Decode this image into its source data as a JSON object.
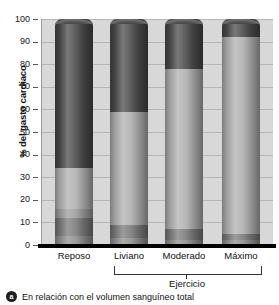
{
  "chart_data": {
    "type": "bar",
    "title": "",
    "subtitle": "",
    "xlabel": "",
    "ylabel": "% del gasto cardiaco",
    "ylim": [
      0,
      100
    ],
    "yticks": [
      0,
      10,
      20,
      30,
      40,
      50,
      60,
      70,
      80,
      90,
      100
    ],
    "grid": true,
    "stacked": true,
    "legend": "none",
    "categories": [
      "Reposo",
      "Liviano",
      "Moderado",
      "Máximo"
    ],
    "series": [
      {
        "name": "segmento-inferior-1",
        "values": [
          4,
          3,
          2,
          2
        ],
        "color": "#8f8f8f"
      },
      {
        "name": "segmento-inferior-2",
        "values": [
          8,
          6,
          5,
          3
        ],
        "color": "#7a7a7a"
      },
      {
        "name": "segmento-medio-bajo",
        "values": [
          4,
          0,
          0,
          0
        ],
        "color": "#9c9c9c"
      },
      {
        "name": "segmento-medio",
        "values": [
          18,
          50,
          71,
          87
        ],
        "color": "#b0b0b0"
      },
      {
        "name": "segmento-superior",
        "values": [
          66,
          41,
          22,
          8
        ],
        "color": "#4a4a4a"
      }
    ],
    "bar_boundaries": {
      "Reposo": [
        0,
        4,
        12,
        16,
        34,
        100
      ],
      "Liviano": [
        0,
        3,
        9,
        9,
        59,
        100
      ],
      "Moderado": [
        0,
        2,
        7,
        7,
        78,
        100
      ],
      "Máximo": [
        0,
        2,
        5,
        5,
        92,
        100
      ]
    },
    "annotations": {
      "bracket_label": "Ejercicio",
      "bracket_spans": [
        "Liviano",
        "Moderado",
        "Máximo"
      ]
    }
  },
  "axis": {
    "y_title": "% del gasto cardiaco",
    "tick_labels": [
      "100",
      "90",
      "80",
      "70",
      "60",
      "50",
      "40",
      "30",
      "20",
      "10",
      "0"
    ]
  },
  "categories": [
    {
      "label": "Reposo"
    },
    {
      "label": "Liviano"
    },
    {
      "label": "Moderado"
    },
    {
      "label": "Máximo"
    }
  ],
  "bracket": {
    "label": "Ejercicio"
  },
  "footnote": {
    "badge": "a",
    "text": "En relación con el volumen sanguíneo total"
  },
  "colors": {
    "plot_background": "#d8d8d8",
    "gridline": "#b6b6b6",
    "baseline": "#000000",
    "seg_dark": "#4a4a4a",
    "seg_light": "#b0b0b0",
    "seg_mid": "#9c9c9c",
    "seg_low1": "#7a7a7a",
    "seg_low2": "#8f8f8f"
  }
}
